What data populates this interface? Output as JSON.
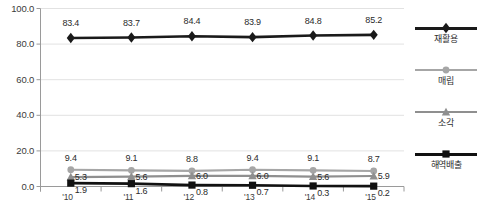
{
  "chart_data": {
    "type": "line",
    "title": "",
    "xlabel": "",
    "ylabel": "",
    "categories": [
      "'10",
      "'11",
      "'12",
      "'13",
      "'14",
      "'15"
    ],
    "ylim": [
      0.0,
      100.0
    ],
    "ytick_step": 20.0,
    "ytick_labels": [
      "100.0",
      "80.0",
      "60.0",
      "40.0",
      "20.0",
      "0.0"
    ],
    "ytick_values": [
      100.0,
      80.0,
      60.0,
      40.0,
      20.0,
      0.0
    ],
    "grid": "horizontal",
    "legend_position": "right",
    "series": [
      {
        "name": "재활용",
        "marker": "diamond",
        "color": "#1a1a1a",
        "line_width": 2.6,
        "values": [
          83.4,
          83.7,
          84.4,
          83.9,
          84.8,
          85.2
        ],
        "labels": [
          "83.4",
          "83.7",
          "84.4",
          "83.9",
          "84.8",
          "85.2"
        ]
      },
      {
        "name": "매립",
        "marker": "circle",
        "color": "#a6a6a6",
        "line_width": 2.2,
        "values": [
          9.4,
          9.1,
          8.8,
          9.4,
          9.1,
          8.7
        ],
        "labels": [
          "9.4",
          "9.1",
          "8.8",
          "9.4",
          "9.1",
          "8.7"
        ]
      },
      {
        "name": "소각",
        "marker": "triangle",
        "color": "#8f8f8f",
        "line_width": 2.2,
        "values": [
          5.3,
          5.6,
          6.0,
          6.0,
          5.6,
          5.9
        ],
        "labels": [
          "5.3",
          "5.6",
          "6.0",
          "6.0",
          "5.6",
          "5.9"
        ]
      },
      {
        "name": "해역배출",
        "marker": "square",
        "color": "#111111",
        "line_width": 2.6,
        "values": [
          1.9,
          1.6,
          0.8,
          0.7,
          0.3,
          0.2
        ],
        "labels": [
          "1.9",
          "1.6",
          "0.8",
          "0.7",
          "0.3",
          "0.2"
        ]
      }
    ]
  },
  "legend": {
    "items": [
      {
        "label": "재활용"
      },
      {
        "label": "매립"
      },
      {
        "label": "소각"
      },
      {
        "label": "해역배출"
      }
    ]
  },
  "caption": {
    "text": ""
  }
}
